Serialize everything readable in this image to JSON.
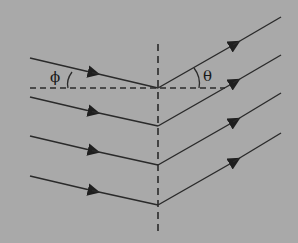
{
  "diagram": {
    "type": "ray-reflection",
    "background": "#a9a9a9",
    "line_color": "#2a2a2a",
    "labels": {
      "incident_angle": "ϕ",
      "reflected_angle": "θ"
    },
    "normal_line": {
      "x": 158,
      "y1": 44,
      "y2": 234,
      "style": "dashed"
    },
    "horizontal_reference": {
      "y": 88,
      "x1": 30,
      "x2": 225,
      "style": "dashed"
    },
    "rays": [
      {
        "start": [
          30,
          58
        ],
        "vertex": [
          158,
          88
        ],
        "end": [
          281,
          17
        ]
      },
      {
        "start": [
          30,
          97
        ],
        "vertex": [
          158,
          126
        ],
        "end": [
          281,
          55
        ]
      },
      {
        "start": [
          30,
          136
        ],
        "vertex": [
          158,
          165
        ],
        "end": [
          281,
          93
        ]
      },
      {
        "start": [
          30,
          176
        ],
        "vertex": [
          158,
          205
        ],
        "end": [
          281,
          133
        ]
      }
    ]
  }
}
